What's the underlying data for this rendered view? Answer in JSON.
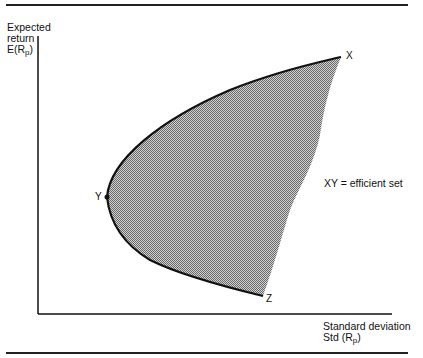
{
  "diagram": {
    "y_axis_label": {
      "line1": "Expected",
      "line2": "return",
      "line3_main": "E(R",
      "line3_sub": "p",
      "line3_end": ")"
    },
    "x_axis_label": {
      "line1": "Standard deviation",
      "line2_main": "Std (R",
      "line2_sub": "p",
      "line2_end": ")"
    },
    "points": {
      "x": "X",
      "y": "Y",
      "z": "Z"
    },
    "legend": "XY = efficient set",
    "colors": {
      "line": "#111111",
      "shade": "#a8a8a8",
      "background": "#ffffff"
    }
  }
}
